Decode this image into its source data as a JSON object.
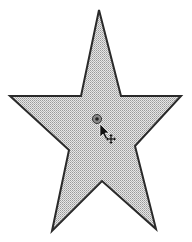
{
  "canvas": {
    "background": "#ffffff",
    "width": 192,
    "height": 242
  },
  "shape": {
    "type": "star",
    "fill_color": "#c8c8c8",
    "fill_pattern": "dotted-halftone",
    "stroke_color": "#2a2a2a",
    "stroke_width": 2,
    "points": "99,10 121,96 181,96 135,146 156,229 102,181 52,231 69,150 10,96 81,96"
  },
  "center_handle": {
    "x": 97,
    "y": 119,
    "icon": "rotation-center-handle-icon"
  },
  "cursor": {
    "type": "arrow-with-move",
    "x": 100,
    "y": 124,
    "icon": "move-cursor-icon"
  }
}
